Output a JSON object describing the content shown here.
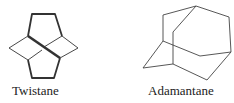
{
  "molecules": [
    {
      "name": "Twistane"
    },
    {
      "name": "Adamantane"
    }
  ],
  "colors": {
    "stroke": "#333333",
    "background": "#ffffff"
  }
}
